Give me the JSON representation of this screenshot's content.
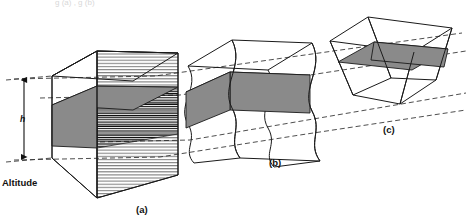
{
  "figure": {
    "title_cropped": "g (a) , g (b)",
    "axis": {
      "label": "Altitude",
      "height_marker": "h",
      "arrow_style": "double-headed-vertical",
      "top_y": 77,
      "bottom_y": 158
    },
    "panels": [
      {
        "id": "a",
        "label": "(a)",
        "label_x": 144,
        "label_y": 210,
        "shape": "rectangular-box",
        "description": "upright rectangular prism with horizontal line hatching on front face and shaded horizontal slab",
        "shading_color": "#8a8a8a",
        "hatched": true
      },
      {
        "id": "b",
        "label": "(b)",
        "label_x": 277,
        "label_y": 163,
        "shape": "wavy-sided-box",
        "description": "prism with S-curved vertical side edges and shaded horizontal slab",
        "shading_color": "#8a8a8a",
        "hatched": false
      },
      {
        "id": "c",
        "label": "(c)",
        "label_x": 391,
        "label_y": 130,
        "shape": "sheared-parallelepiped",
        "description": "slanted parallelepiped cell with shaded horizontal slab",
        "shading_color": "#8a8a8a",
        "hatched": false
      }
    ],
    "colors": {
      "line": "#1a1a1a",
      "dashed_guide": "#3a3a3a",
      "shade_fill": "#8a8a8a",
      "background": "#ffffff"
    }
  }
}
